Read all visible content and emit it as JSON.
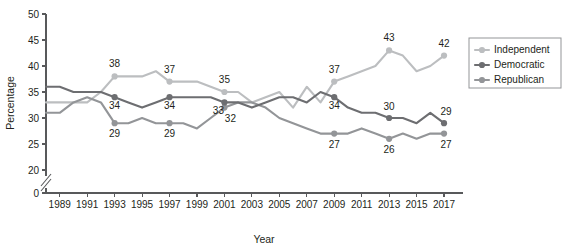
{
  "chart_data": {
    "type": "line",
    "title": "",
    "xlabel": "Year",
    "ylabel": "Percentage",
    "x": [
      1988,
      1989,
      1990,
      1991,
      1992,
      1993,
      1994,
      1995,
      1996,
      1997,
      1998,
      1999,
      2000,
      2001,
      2002,
      2003,
      2004,
      2005,
      2006,
      2007,
      2008,
      2009,
      2010,
      2011,
      2012,
      2013,
      2014,
      2015,
      2016,
      2017
    ],
    "xlim": [
      1988,
      2017.8
    ],
    "ylim": [
      20,
      50
    ],
    "y_break": true,
    "y_break_from": 0,
    "y_break_to": 20,
    "yticks": [
      "0",
      "20",
      "25",
      "30",
      "35",
      "40",
      "45",
      "50"
    ],
    "ytick_values": [
      0,
      20,
      25,
      30,
      35,
      40,
      45,
      50
    ],
    "xticks": [
      "1989",
      "1991",
      "1993",
      "1995",
      "1997",
      "1999",
      "2001",
      "2003",
      "2005",
      "2007",
      "2009",
      "2011",
      "2013",
      "2015",
      "2017"
    ],
    "xtick_values": [
      1989,
      1991,
      1993,
      1995,
      1997,
      1999,
      2001,
      2003,
      2005,
      2007,
      2009,
      2011,
      2013,
      2015,
      2017
    ],
    "grid": false,
    "legend_position": "right",
    "series": [
      {
        "name": "Independent",
        "color": "#bcbec0",
        "values": [
          33,
          33,
          33,
          33,
          35,
          38,
          38,
          38,
          39,
          37,
          37,
          37,
          36,
          35,
          35,
          33,
          34,
          35,
          32,
          36,
          33,
          37,
          38,
          39,
          40,
          43,
          42,
          39,
          40,
          42
        ],
        "labeled_points": [
          {
            "x": 1993,
            "y": 38,
            "label": "38",
            "dx": 0,
            "dy": -9
          },
          {
            "x": 1997,
            "y": 37,
            "label": "37",
            "dx": 0,
            "dy": -9
          },
          {
            "x": 2001,
            "y": 35,
            "label": "35",
            "dx": 0,
            "dy": -9
          },
          {
            "x": 2009,
            "y": 37,
            "label": "37",
            "dx": 0,
            "dy": -9
          },
          {
            "x": 2013,
            "y": 43,
            "label": "43",
            "dx": 0,
            "dy": -9
          },
          {
            "x": 2017,
            "y": 42,
            "label": "42",
            "dx": 0,
            "dy": -9
          }
        ]
      },
      {
        "name": "Democratic",
        "color": "#6d6e71",
        "values": [
          36,
          36,
          35,
          35,
          35,
          34,
          33,
          32,
          33,
          34,
          34,
          34,
          34,
          33,
          33,
          32,
          33,
          34,
          34,
          33,
          35,
          34,
          32,
          31,
          31,
          30,
          30,
          29,
          31,
          29
        ],
        "labeled_points": [
          {
            "x": 1993,
            "y": 34,
            "label": "34",
            "dx": 0,
            "dy": 12
          },
          {
            "x": 1997,
            "y": 34,
            "label": "34",
            "dx": 0,
            "dy": 12
          },
          {
            "x": 2001,
            "y": 33,
            "label": "33",
            "dx": -6,
            "dy": 12
          },
          {
            "x": 2009,
            "y": 34,
            "label": "34",
            "dx": 0,
            "dy": 12
          },
          {
            "x": 2013,
            "y": 30,
            "label": "30",
            "dx": 0,
            "dy": -8
          },
          {
            "x": 2017,
            "y": 29,
            "label": "29",
            "dx": 2,
            "dy": -8
          }
        ]
      },
      {
        "name": "Republican",
        "color": "#939598",
        "values": [
          31,
          31,
          33,
          34,
          33,
          29,
          29,
          30,
          29,
          29,
          29,
          28,
          30,
          32,
          33,
          33,
          32,
          30,
          29,
          28,
          27,
          27,
          27,
          28,
          27,
          26,
          27,
          26,
          27,
          27
        ],
        "labeled_points": [
          {
            "x": 1993,
            "y": 29,
            "label": "29",
            "dx": 0,
            "dy": 14
          },
          {
            "x": 1997,
            "y": 29,
            "label": "29",
            "dx": 0,
            "dy": 14
          },
          {
            "x": 2001,
            "y": 32,
            "label": "32",
            "dx": 6,
            "dy": 14
          },
          {
            "x": 2009,
            "y": 27,
            "label": "27",
            "dx": 0,
            "dy": 14
          },
          {
            "x": 2013,
            "y": 26,
            "label": "26",
            "dx": 0,
            "dy": 14
          },
          {
            "x": 2017,
            "y": 27,
            "label": "27",
            "dx": 2,
            "dy": 14
          }
        ]
      }
    ]
  },
  "legend": {
    "items": [
      {
        "label": "Independent",
        "color": "#bcbec0"
      },
      {
        "label": "Democratic",
        "color": "#6d6e71"
      },
      {
        "label": "Republican",
        "color": "#939598"
      }
    ]
  }
}
